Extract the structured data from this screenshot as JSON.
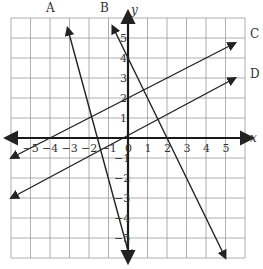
{
  "chart_data": {
    "type": "line",
    "title": "",
    "xlabel": "x",
    "ylabel": "y",
    "xlim": [
      -6,
      6
    ],
    "ylim": [
      -6,
      6
    ],
    "grid": true,
    "x_ticks": [
      "-5",
      "-4",
      "-3",
      "-2",
      "-1",
      "0",
      "1",
      "2",
      "3",
      "4",
      "5"
    ],
    "y_ticks": [
      "5",
      "4",
      "3",
      "2",
      "1",
      "-1",
      "-2",
      "-3",
      "-4",
      "-5"
    ],
    "series": [
      {
        "name": "A",
        "equation": "y = -3.5x - 5.5",
        "points": [
          [
            -3.1,
            5.5
          ],
          [
            0.1,
            -6
          ]
        ]
      },
      {
        "name": "B",
        "equation": "y = -2x + 4",
        "points": [
          [
            -0.8,
            5.6
          ],
          [
            5,
            -6
          ]
        ]
      },
      {
        "name": "C",
        "equation": "y = 0.5x + 2",
        "points": [
          [
            -6,
            -1
          ],
          [
            5.5,
            4.75
          ]
        ]
      },
      {
        "name": "D",
        "equation": "y = 0.55x",
        "points": [
          [
            -6,
            -3
          ],
          [
            5.5,
            3
          ]
        ]
      }
    ]
  },
  "labels": {
    "A": "A",
    "B": "B",
    "C": "C",
    "D": "D",
    "x": "x",
    "y": "y",
    "zero": "0"
  }
}
